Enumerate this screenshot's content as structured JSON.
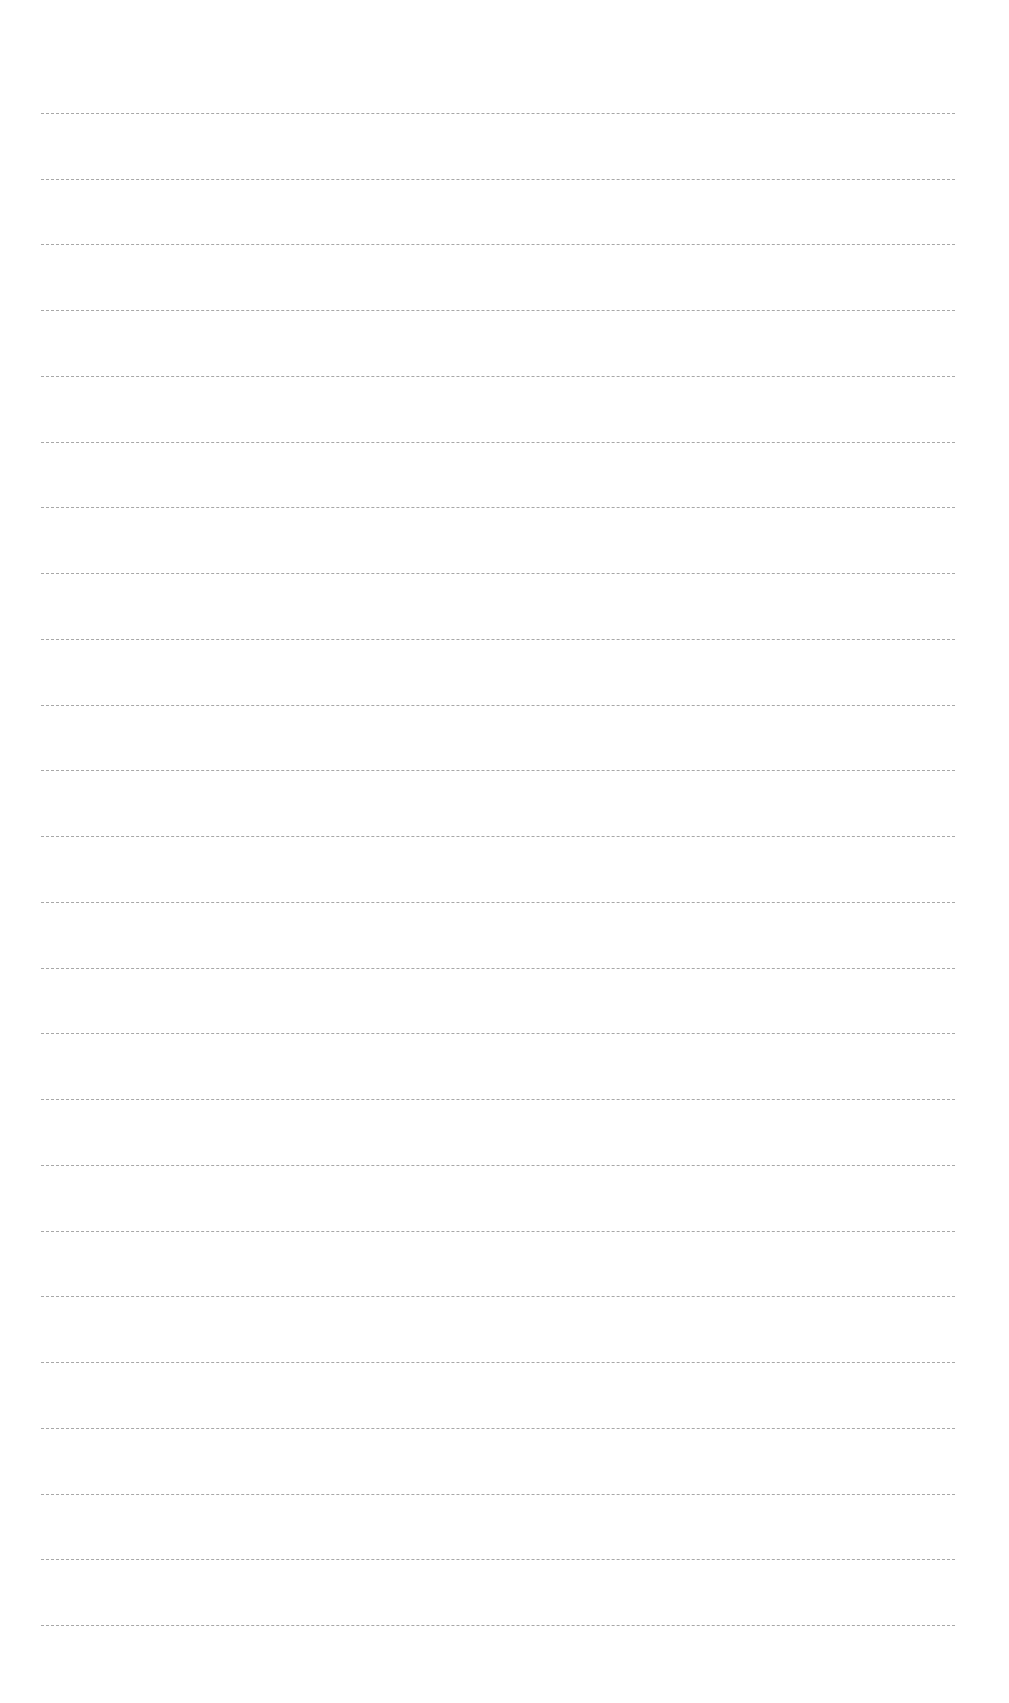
{
  "page": {
    "type": "lined-paper",
    "background": "#ffffff",
    "line_color": "#9a9a9a",
    "line_count": 24,
    "first_line_y": 113,
    "last_line_y": 1625,
    "line_left_x": 41,
    "line_right_x": 955,
    "text": ""
  }
}
